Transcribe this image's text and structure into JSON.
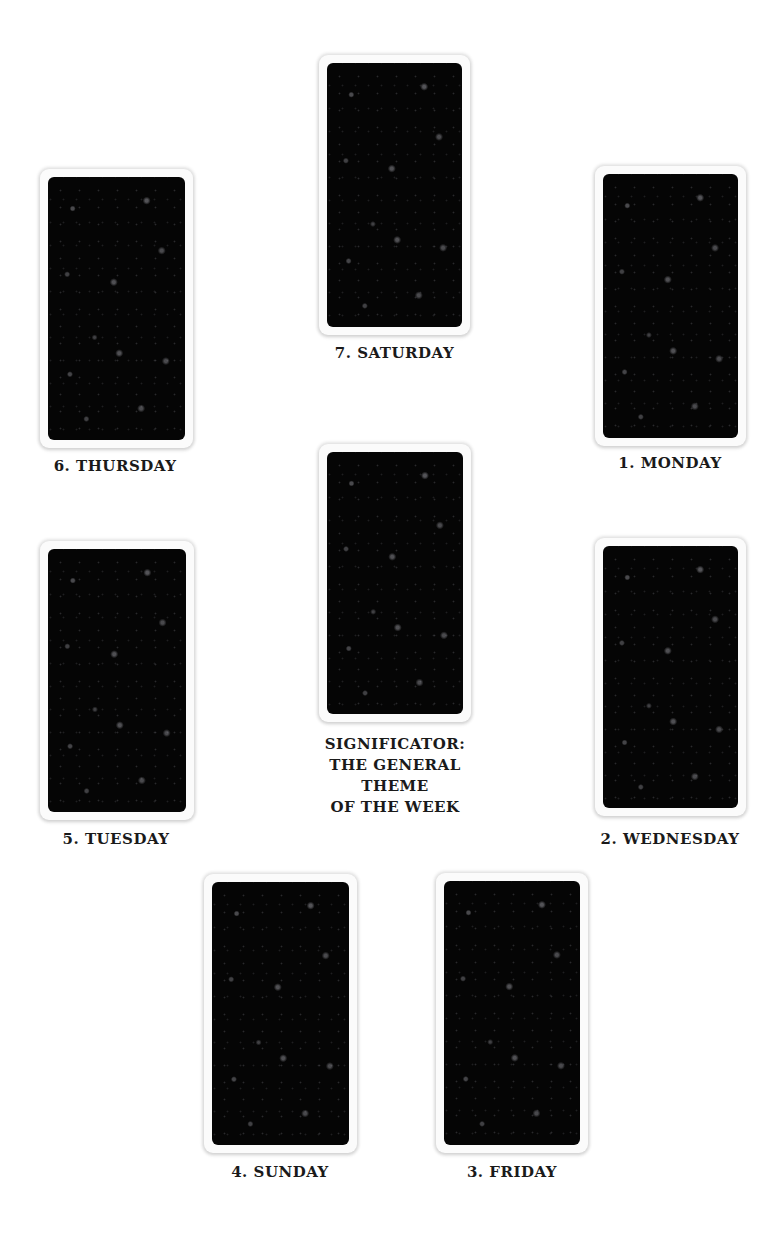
{
  "spread": {
    "positions": [
      {
        "id": "saturday",
        "label": "7. SATURDAY"
      },
      {
        "id": "thursday",
        "label": "6. THURSDAY"
      },
      {
        "id": "monday",
        "label": "1. MONDAY"
      },
      {
        "id": "significator",
        "label_lines": [
          "SIGNIFICATOR:",
          "THE GENERAL THEME",
          "OF THE WEEK"
        ]
      },
      {
        "id": "tuesday",
        "label": "5. TUESDAY"
      },
      {
        "id": "wednesday",
        "label": "2. WEDNESDAY"
      },
      {
        "id": "sunday",
        "label": "4. SUNDAY"
      },
      {
        "id": "friday",
        "label": "3. FRIDAY"
      }
    ]
  },
  "colors": {
    "background": "#ffffff",
    "card_frame": "#fbfbfb",
    "card_back": "#050505",
    "label_text": "#1a1a1a"
  }
}
